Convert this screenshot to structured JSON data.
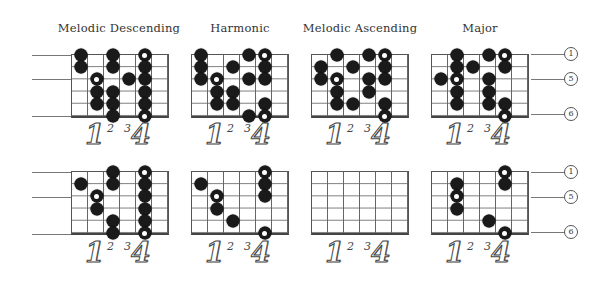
{
  "titles": [
    "Melodic Descending",
    "Harmonic",
    "Melodic Ascending",
    "Major"
  ],
  "finger_labels": [
    "1",
    "2",
    "3",
    "4"
  ],
  "string_labels": [
    {
      "string": 1,
      "label": "1"
    },
    {
      "string": 3,
      "label": "5"
    },
    {
      "string": 6,
      "label": "6"
    }
  ],
  "grid": {
    "columns": 6,
    "strings": 6
  },
  "diagrams": {
    "top": [
      {
        "title": "Melodic Descending",
        "dots": [
          {
            "col": 1,
            "str": 1
          },
          {
            "col": 1,
            "str": 2
          },
          {
            "col": 2,
            "str": 3,
            "root": true
          },
          {
            "col": 2,
            "str": 4
          },
          {
            "col": 2,
            "str": 5
          },
          {
            "col": 3,
            "str": 1
          },
          {
            "col": 3,
            "str": 2
          },
          {
            "col": 3,
            "str": 4
          },
          {
            "col": 3,
            "str": 5
          },
          {
            "col": 3,
            "str": 6
          },
          {
            "col": 4,
            "str": 3
          },
          {
            "col": 5,
            "str": 1,
            "root": true
          },
          {
            "col": 5,
            "str": 2
          },
          {
            "col": 5,
            "str": 3
          },
          {
            "col": 5,
            "str": 4
          },
          {
            "col": 5,
            "str": 5
          },
          {
            "col": 5,
            "str": 6,
            "root": true
          }
        ]
      },
      {
        "title": "Harmonic",
        "dots": [
          {
            "col": 1,
            "str": 1
          },
          {
            "col": 1,
            "str": 2
          },
          {
            "col": 1,
            "str": 3
          },
          {
            "col": 2,
            "str": 3,
            "root": true
          },
          {
            "col": 2,
            "str": 4
          },
          {
            "col": 2,
            "str": 5
          },
          {
            "col": 3,
            "str": 2
          },
          {
            "col": 3,
            "str": 4
          },
          {
            "col": 3,
            "str": 5
          },
          {
            "col": 4,
            "str": 1
          },
          {
            "col": 4,
            "str": 3
          },
          {
            "col": 4,
            "str": 6
          },
          {
            "col": 5,
            "str": 1,
            "root": true
          },
          {
            "col": 5,
            "str": 2
          },
          {
            "col": 5,
            "str": 3
          },
          {
            "col": 5,
            "str": 5
          },
          {
            "col": 5,
            "str": 6,
            "root": true
          }
        ]
      },
      {
        "title": "Melodic Ascending",
        "dots": [
          {
            "col": 1,
            "str": 2
          },
          {
            "col": 1,
            "str": 3
          },
          {
            "col": 2,
            "str": 1
          },
          {
            "col": 2,
            "str": 3,
            "root": true
          },
          {
            "col": 2,
            "str": 4
          },
          {
            "col": 2,
            "str": 5
          },
          {
            "col": 3,
            "str": 2
          },
          {
            "col": 3,
            "str": 5
          },
          {
            "col": 4,
            "str": 1
          },
          {
            "col": 4,
            "str": 3
          },
          {
            "col": 4,
            "str": 4
          },
          {
            "col": 5,
            "str": 1,
            "root": true
          },
          {
            "col": 5,
            "str": 2
          },
          {
            "col": 5,
            "str": 3
          },
          {
            "col": 5,
            "str": 5
          },
          {
            "col": 5,
            "str": 6,
            "root": true
          }
        ]
      },
      {
        "title": "Major",
        "dots": [
          {
            "col": 1,
            "str": 3
          },
          {
            "col": 2,
            "str": 1
          },
          {
            "col": 2,
            "str": 2
          },
          {
            "col": 2,
            "str": 3,
            "root": true
          },
          {
            "col": 2,
            "str": 4
          },
          {
            "col": 2,
            "str": 5
          },
          {
            "col": 3,
            "str": 2
          },
          {
            "col": 4,
            "str": 1
          },
          {
            "col": 4,
            "str": 3
          },
          {
            "col": 4,
            "str": 4
          },
          {
            "col": 4,
            "str": 5
          },
          {
            "col": 5,
            "str": 1,
            "root": true
          },
          {
            "col": 5,
            "str": 2
          },
          {
            "col": 5,
            "str": 5
          },
          {
            "col": 5,
            "str": 6,
            "root": true
          }
        ]
      }
    ],
    "bottom": [
      {
        "dots": [
          {
            "col": 1,
            "str": 2
          },
          {
            "col": 2,
            "str": 3,
            "root": true
          },
          {
            "col": 2,
            "str": 4
          },
          {
            "col": 3,
            "str": 1
          },
          {
            "col": 3,
            "str": 2
          },
          {
            "col": 3,
            "str": 5
          },
          {
            "col": 3,
            "str": 6
          },
          {
            "col": 5,
            "str": 1,
            "root": true
          },
          {
            "col": 5,
            "str": 2
          },
          {
            "col": 5,
            "str": 3
          },
          {
            "col": 5,
            "str": 4
          },
          {
            "col": 5,
            "str": 5
          },
          {
            "col": 5,
            "str": 6,
            "root": true
          }
        ]
      },
      {
        "dots": [
          {
            "col": 1,
            "str": 2
          },
          {
            "col": 2,
            "str": 3,
            "root": true
          },
          {
            "col": 2,
            "str": 4
          },
          {
            "col": 3,
            "str": 5
          },
          {
            "col": 5,
            "str": 1,
            "root": true
          },
          {
            "col": 5,
            "str": 2
          },
          {
            "col": 5,
            "str": 3
          },
          {
            "col": 5,
            "str": 6,
            "root": true
          }
        ]
      },
      {
        "dots": []
      },
      {
        "dots": [
          {
            "col": 2,
            "str": 2
          },
          {
            "col": 2,
            "str": 3,
            "root": true
          },
          {
            "col": 2,
            "str": 4
          },
          {
            "col": 4,
            "str": 5
          },
          {
            "col": 5,
            "str": 1,
            "root": true
          },
          {
            "col": 5,
            "str": 2
          },
          {
            "col": 5,
            "str": 6,
            "root": true
          }
        ]
      }
    ]
  }
}
